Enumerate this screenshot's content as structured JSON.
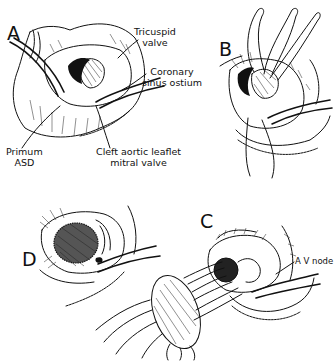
{
  "figure": {
    "panels": [
      {
        "id": "A",
        "letter": "A"
      },
      {
        "id": "B",
        "letter": "B"
      },
      {
        "id": "C",
        "letter": "C"
      },
      {
        "id": "D",
        "letter": "D"
      }
    ],
    "labels": {
      "tricuspid_valve": {
        "line1": "Tricuspid",
        "line2": "valve"
      },
      "coronary_sinus_ostium": {
        "line1": "Coronary",
        "line2": "sinus ostium"
      },
      "primum_asd": {
        "line1": "Primum",
        "line2": "ASD"
      },
      "cleft_mitral": {
        "line1": "Cleft aortic leaflet",
        "line2": "mitral valve"
      },
      "av_node": {
        "line1": "A V node"
      }
    },
    "colors": {
      "ink": "#111111",
      "background": "#ffffff"
    }
  }
}
